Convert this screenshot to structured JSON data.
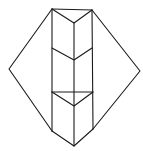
{
  "diagram": {
    "stroke_color": "#1a1a1a",
    "background_color": "#ffffff",
    "vertices": {
      "top_left": [
        52,
        9
      ],
      "top_right": [
        92,
        10
      ],
      "top_chevron_mid": [
        74,
        23
      ],
      "mid_left": [
        52,
        48
      ],
      "mid_right": [
        92,
        48
      ],
      "mid_chevron_mid": [
        74,
        60
      ],
      "bar_left": [
        52,
        92
      ],
      "bar_right": [
        93,
        92
      ],
      "low_chevron_mid": [
        74,
        106
      ],
      "bottom_left": [
        52,
        131
      ],
      "bottom_right": [
        93,
        129
      ],
      "bottom_tip": [
        74,
        146
      ],
      "left_point": [
        9,
        69
      ],
      "right_point": [
        140,
        71
      ]
    }
  }
}
